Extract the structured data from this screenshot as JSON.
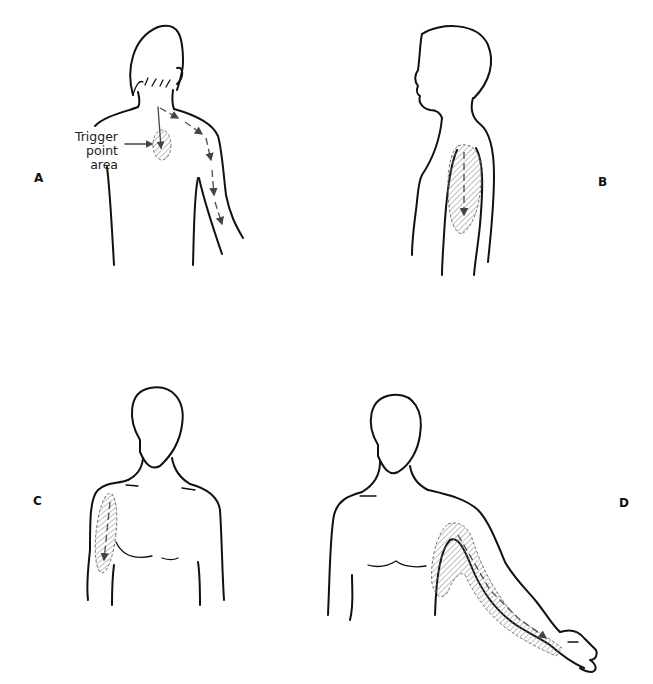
{
  "figure": {
    "panels": [
      {
        "id": "A",
        "label": "A",
        "view": "posterior",
        "region": "upper back and posterior arm",
        "callout": {
          "line1": "Trigger point",
          "line2": "area"
        }
      },
      {
        "id": "B",
        "label": "B",
        "view": "lateral",
        "region": "lateral upper arm"
      },
      {
        "id": "C",
        "label": "C",
        "view": "anterior",
        "region": "anterior upper arm"
      },
      {
        "id": "D",
        "label": "D",
        "view": "anterior, arm abducted",
        "region": "anterior chest, medial arm, forearm and hand"
      }
    ],
    "colors": {
      "outline": "#111111",
      "hatch": "#888888",
      "background": "#ffffff"
    }
  }
}
